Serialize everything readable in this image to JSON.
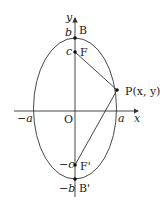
{
  "diagram": {
    "axes": {
      "x_label": "x",
      "y_label": "y",
      "origin_label": "O"
    },
    "labels": {
      "b": "b",
      "c": "c",
      "neg_c": "−c",
      "neg_b": "−b",
      "a": "a",
      "neg_a": "−a",
      "B": "B",
      "F": "F",
      "F_prime": "F'",
      "B_prime": "B'",
      "P": "P(x, y)"
    },
    "colors": {
      "stroke": "#333333",
      "point": "#111111"
    }
  }
}
